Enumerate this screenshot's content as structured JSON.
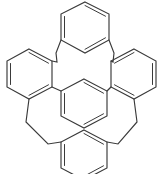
{
  "figure": {
    "kind": "chemical-structure-diagram",
    "subtitle": "",
    "background_color": "#ffffff",
    "line_color": "#3a3a3a",
    "width": 163,
    "height": 174,
    "labels": [],
    "annotations": [],
    "atom_labels": [],
    "charges": []
  },
  "molecule": {
    "ring_count": 5,
    "bridge_count": 4,
    "direct_bond_count": 2,
    "ring_type": "benzene",
    "bridge_type": "ethylene (-CH2-CH2-)",
    "rings": [
      {
        "name": "top-ring",
        "substitution": "meta",
        "center": [
          85,
          27
        ],
        "radius": 25,
        "rotation": 0,
        "double_bond_positions": [
          0,
          2,
          4
        ]
      },
      {
        "name": "left-ring",
        "substitution": "ortho",
        "center": [
          29,
          74
        ],
        "radius": 25,
        "rotation": 0,
        "double_bond_positions": [
          0,
          2,
          4
        ]
      },
      {
        "name": "right-ring",
        "substitution": "ortho",
        "center": [
          134,
          74
        ],
        "radius": 25,
        "rotation": 0,
        "double_bond_positions": [
          0,
          2,
          4
        ]
      },
      {
        "name": "center-ring",
        "substitution": "meta",
        "center": [
          84,
          103
        ],
        "radius": 24,
        "rotation": 0,
        "double_bond_positions": [
          0,
          2,
          4
        ]
      },
      {
        "name": "bottom-ring",
        "substitution": "meta",
        "center": [
          84,
          155
        ],
        "radius": 25,
        "rotation": 0,
        "double_bond_positions": [
          0,
          2,
          4
        ]
      }
    ],
    "bridges": [
      {
        "name": "bridge-top-left",
        "from": "top-ring",
        "to": "left-ring"
      },
      {
        "name": "bridge-top-right",
        "from": "top-ring",
        "to": "right-ring"
      },
      {
        "name": "bridge-bottom-left",
        "from": "left-ring",
        "to": "bottom-ring"
      },
      {
        "name": "bridge-bottom-right",
        "from": "right-ring",
        "to": "bottom-ring"
      }
    ],
    "direct_bonds": [
      {
        "name": "bond-left-to-center",
        "from": "left-ring",
        "to": "center-ring"
      },
      {
        "name": "bond-right-to-center",
        "from": "right-ring",
        "to": "center-ring"
      }
    ]
  }
}
